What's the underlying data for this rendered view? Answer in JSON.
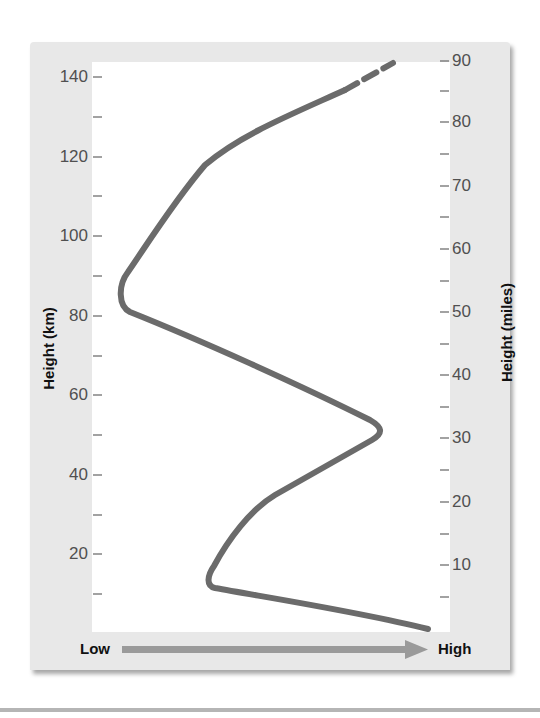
{
  "chart_data": {
    "type": "line",
    "title": "",
    "xlabel": "Temperature (Low → High)",
    "ylabel": "Height (km)",
    "ylabel_right": "Height (miles)",
    "x_axis": {
      "label_low": "Low",
      "label_high": "High",
      "arrow": true,
      "numeric_ticks": false
    },
    "y_axis_left": {
      "label": "Height (km)",
      "range": [
        0,
        145
      ],
      "major_ticks": [
        20,
        40,
        60,
        80,
        100,
        120,
        140
      ],
      "minor_ticks": [
        10,
        30,
        50,
        70,
        90,
        110,
        130
      ]
    },
    "y_axis_right": {
      "label": "Height (miles)",
      "range": [
        0,
        90
      ],
      "major_ticks": [
        10,
        20,
        30,
        40,
        50,
        60,
        70,
        80,
        90
      ],
      "minor_ticks": [
        5,
        15,
        25,
        35,
        45,
        55,
        65,
        75,
        85
      ]
    },
    "grid": false,
    "legend": null,
    "series": [
      {
        "name": "Temperature profile",
        "x_relative": "0 = low, 1 = high temperature (unitless)",
        "points": [
          {
            "height_km": 0.5,
            "temp_rel": 0.94
          },
          {
            "height_km": 6,
            "temp_rel": 0.62
          },
          {
            "height_km": 12,
            "temp_rel": 0.34
          },
          {
            "height_km": 16,
            "temp_rel": 0.33
          },
          {
            "height_km": 25,
            "temp_rel": 0.41
          },
          {
            "height_km": 33,
            "temp_rel": 0.51
          },
          {
            "height_km": 42,
            "temp_rel": 0.68
          },
          {
            "height_km": 50,
            "temp_rel": 0.8
          },
          {
            "height_km": 53,
            "temp_rel": 0.79
          },
          {
            "height_km": 68,
            "temp_rel": 0.44
          },
          {
            "height_km": 81,
            "temp_rel": 0.1
          },
          {
            "height_km": 87,
            "temp_rel": 0.08
          },
          {
            "height_km": 100,
            "temp_rel": 0.18
          },
          {
            "height_km": 113,
            "temp_rel": 0.3
          },
          {
            "height_km": 120,
            "temp_rel": 0.39
          },
          {
            "height_km": 127,
            "temp_rel": 0.53
          },
          {
            "height_km": 133,
            "temp_rel": 0.66
          }
        ],
        "dashed_extension": [
          {
            "height_km": 133,
            "temp_rel": 0.66
          },
          {
            "height_km": 145,
            "temp_rel": 0.86
          }
        ],
        "color": "#6b6b6b"
      }
    ]
  },
  "axes": {
    "left": {
      "title": "Height (km)",
      "ticks": [
        {
          "value": "140",
          "y": 77
        },
        {
          "value": "120",
          "y": 157
        },
        {
          "value": "100",
          "y": 236
        },
        {
          "value": "80",
          "y": 316
        },
        {
          "value": "60",
          "y": 395
        },
        {
          "value": "40",
          "y": 475
        },
        {
          "value": "20",
          "y": 554
        }
      ],
      "minor_y": [
        117,
        196,
        276,
        356,
        435,
        515,
        594
      ]
    },
    "right": {
      "title": "Height (miles)",
      "ticks": [
        {
          "value": "90",
          "y": 61
        },
        {
          "value": "80",
          "y": 122
        },
        {
          "value": "70",
          "y": 186
        },
        {
          "value": "60",
          "y": 249
        },
        {
          "value": "50",
          "y": 312
        },
        {
          "value": "40",
          "y": 375
        },
        {
          "value": "30",
          "y": 438
        },
        {
          "value": "20",
          "y": 502
        },
        {
          "value": "10",
          "y": 565
        }
      ],
      "minor_y": [
        91,
        154,
        217,
        281,
        344,
        407,
        470,
        534,
        597
      ]
    },
    "bottom": {
      "low_label": "Low",
      "high_label": "High"
    }
  },
  "colors": {
    "panel": "#e8e8e8",
    "plot": "#ffffff",
    "curve": "#6b6b6b",
    "arrow": "#9a9a9a",
    "tick": "#707070",
    "label": "#505050"
  }
}
